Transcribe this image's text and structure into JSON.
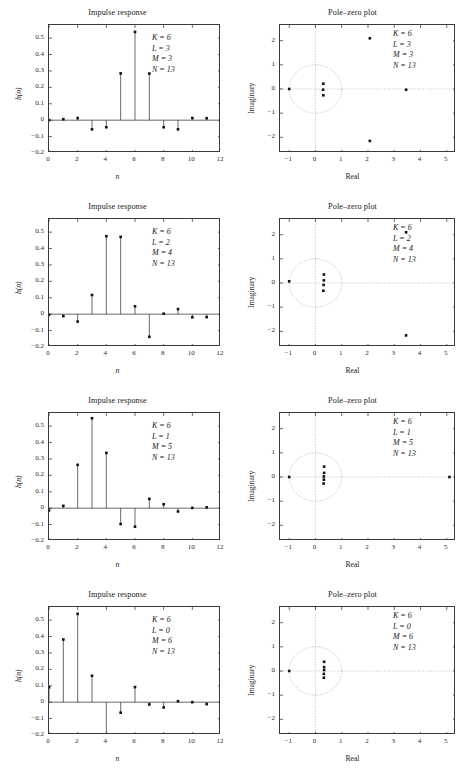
{
  "figure": {
    "width": 470,
    "height": 776,
    "background": "#ffffff",
    "ink": "#1a1a1a"
  },
  "titles": {
    "impulse": "Impulse response",
    "polezero": "Pole–zero plot"
  },
  "axes": {
    "impulse": {
      "xlabel": "n",
      "ylabel": "h(n)",
      "xticks": [
        "0",
        "2",
        "4",
        "6",
        "8",
        "10",
        "12"
      ],
      "xtickvals": [
        0,
        2,
        4,
        6,
        8,
        10,
        12
      ],
      "yticks": [
        "0.5",
        "0.4",
        "0.3",
        "0.2",
        "0.1",
        "0",
        "−0.1",
        "−0.2"
      ],
      "ytickvals": [
        0.5,
        0.4,
        0.3,
        0.2,
        0.1,
        0,
        -0.1,
        -0.2
      ],
      "xlim": [
        0,
        12
      ],
      "ylim": [
        -0.2,
        0.58
      ],
      "grid": false
    },
    "polezero": {
      "xlabel": "Real",
      "ylabel": "Imaginary",
      "xticks": [
        "−1",
        "0",
        "1",
        "2",
        "3",
        "4",
        "5"
      ],
      "xtickvals": [
        -1,
        0,
        1,
        2,
        3,
        4,
        5
      ],
      "yticks": [
        "2",
        "1",
        "0",
        "−1",
        "−2"
      ],
      "ytickvals": [
        2,
        1,
        0,
        -1,
        -2
      ],
      "xlim": [
        -1.35,
        5.35
      ],
      "ylim": [
        -2.65,
        2.65
      ],
      "grid": true,
      "unit_circle": true
    }
  },
  "chart_data": [
    {
      "type": "line",
      "subtype": "stem",
      "panel": "impulse",
      "row": 1,
      "title": "Impulse response",
      "xlabel": "n",
      "ylabel": "h(n)",
      "xlim": [
        0,
        12
      ],
      "ylim": [
        -0.2,
        0.58
      ],
      "grid": false,
      "annotations": [
        "K = 6",
        "L = 3",
        "M = 3",
        "N = 13"
      ],
      "x": [
        0,
        1,
        2,
        3,
        4,
        5,
        6,
        7,
        8,
        9,
        10,
        11,
        12
      ],
      "values": [
        0.0,
        0.006,
        0.013,
        -0.056,
        -0.043,
        0.285,
        0.538,
        0.284,
        -0.043,
        -0.056,
        0.013,
        0.012,
        0.0
      ]
    },
    {
      "type": "scatter",
      "panel": "polezero",
      "row": 1,
      "title": "Pole–zero plot",
      "xlabel": "Real",
      "ylabel": "Imaginary",
      "xlim": [
        -1.35,
        5.35
      ],
      "ylim": [
        -2.65,
        2.65
      ],
      "grid": true,
      "unit_circle": true,
      "annotations": [
        "K = 6",
        "L = 3",
        "M = 3",
        "N = 13"
      ],
      "points": [
        {
          "re": -1.0,
          "im": 0.0
        },
        {
          "re": 0.3,
          "im": 0.22
        },
        {
          "re": 0.29,
          "im": -0.03
        },
        {
          "re": 0.3,
          "im": -0.26
        },
        {
          "re": 2.07,
          "im": 2.1
        },
        {
          "re": 2.07,
          "im": -2.15
        },
        {
          "re": 3.45,
          "im": -0.03
        }
      ]
    },
    {
      "type": "line",
      "subtype": "stem",
      "panel": "impulse",
      "row": 2,
      "title": "Impulse response",
      "xlabel": "n",
      "ylabel": "h(n)",
      "xlim": [
        0,
        12
      ],
      "ylim": [
        -0.2,
        0.58
      ],
      "grid": false,
      "annotations": [
        "K = 6",
        "L = 2",
        "M = 4",
        "N = 13"
      ],
      "x": [
        0,
        1,
        2,
        3,
        4,
        5,
        6,
        7,
        8,
        9,
        10,
        11,
        12
      ],
      "values": [
        -0.004,
        -0.012,
        -0.045,
        0.117,
        0.475,
        0.471,
        0.048,
        -0.138,
        0.003,
        0.031,
        -0.019,
        -0.018,
        0.0
      ]
    },
    {
      "type": "scatter",
      "panel": "polezero",
      "row": 2,
      "title": "Pole–zero plot",
      "xlabel": "Real",
      "ylabel": "Imaginary",
      "xlim": [
        -1.35,
        5.35
      ],
      "ylim": [
        -2.65,
        2.65
      ],
      "grid": true,
      "unit_circle": true,
      "annotations": [
        "K = 6",
        "L = 2",
        "M = 4",
        "N = 13"
      ],
      "points": [
        {
          "re": -1.0,
          "im": 0.07
        },
        {
          "re": 0.32,
          "im": 0.35
        },
        {
          "re": 0.32,
          "im": 0.11
        },
        {
          "re": 0.31,
          "im": -0.08
        },
        {
          "re": 0.3,
          "im": -0.32
        },
        {
          "re": 3.45,
          "im": 2.1
        },
        {
          "re": 3.45,
          "im": -2.17
        }
      ]
    },
    {
      "type": "line",
      "subtype": "stem",
      "panel": "impulse",
      "row": 3,
      "title": "Impulse response",
      "xlabel": "n",
      "ylabel": "h(n)",
      "xlim": [
        0,
        12
      ],
      "ylim": [
        -0.2,
        0.58
      ],
      "grid": false,
      "annotations": [
        "K = 6",
        "L = 1",
        "M = 5",
        "N = 13"
      ],
      "x": [
        0,
        1,
        2,
        3,
        4,
        5,
        6,
        7,
        8,
        9,
        10,
        11,
        12
      ],
      "values": [
        -0.014,
        0.014,
        0.264,
        0.548,
        0.337,
        -0.097,
        -0.113,
        0.057,
        0.024,
        -0.02,
        0.002,
        0.005,
        0.0
      ]
    },
    {
      "type": "scatter",
      "panel": "polezero",
      "row": 3,
      "title": "Pole–zero plot",
      "xlabel": "Real",
      "ylabel": "Imaginary",
      "xlim": [
        -1.35,
        5.35
      ],
      "ylim": [
        -2.65,
        2.65
      ],
      "grid": true,
      "unit_circle": true,
      "annotations": [
        "K = 6",
        "L = 1",
        "M = 5",
        "N = 13"
      ],
      "points": [
        {
          "re": -1.0,
          "im": 0.0
        },
        {
          "re": 0.33,
          "im": 0.43
        },
        {
          "re": 0.33,
          "im": 0.17
        },
        {
          "re": 0.32,
          "im": 0.02
        },
        {
          "re": 0.32,
          "im": -0.11
        },
        {
          "re": 0.31,
          "im": -0.27
        },
        {
          "re": 5.1,
          "im": 0.0
        }
      ]
    },
    {
      "type": "line",
      "subtype": "stem",
      "panel": "impulse",
      "row": 4,
      "title": "Impulse response",
      "xlabel": "n",
      "ylabel": "h(n)",
      "xlim": [
        0,
        12
      ],
      "ylim": [
        -0.2,
        0.58
      ],
      "grid": false,
      "annotations": [
        "K = 6",
        "L = 0",
        "M = 6",
        "N = 13"
      ],
      "x": [
        0,
        1,
        2,
        3,
        4,
        5,
        6,
        7,
        8,
        9,
        10,
        11,
        12
      ],
      "values": [
        0.091,
        0.382,
        0.538,
        0.161,
        -0.2,
        -0.064,
        0.092,
        -0.014,
        -0.032,
        0.006,
        0.0,
        -0.012,
        0.0
      ]
    },
    {
      "type": "scatter",
      "panel": "polezero",
      "row": 4,
      "title": "Pole–zero plot",
      "xlabel": "Real",
      "ylabel": "Imaginary",
      "xlim": [
        -1.35,
        5.35
      ],
      "ylim": [
        -2.65,
        2.65
      ],
      "grid": true,
      "unit_circle": true,
      "annotations": [
        "K = 6",
        "L = 0",
        "M = 6",
        "N = 13"
      ],
      "points": [
        {
          "re": -1.0,
          "im": 0.0
        },
        {
          "re": 0.33,
          "im": 0.38
        },
        {
          "re": 0.33,
          "im": 0.16
        },
        {
          "re": 0.33,
          "im": 0.04
        },
        {
          "re": 0.32,
          "im": -0.12
        },
        {
          "re": 0.32,
          "im": -0.28
        }
      ]
    }
  ]
}
